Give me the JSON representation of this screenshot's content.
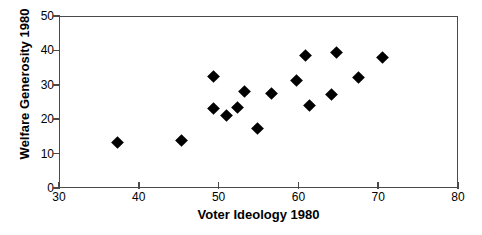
{
  "chart_data": {
    "type": "scatter",
    "title": "",
    "xlabel": "Voter Ideology 1980",
    "ylabel": "Welfare Generosity 1980",
    "xlim": [
      30,
      80
    ],
    "ylim": [
      0,
      50
    ],
    "xticks": [
      30,
      40,
      50,
      60,
      70,
      80
    ],
    "yticks": [
      0,
      10,
      20,
      30,
      40,
      50
    ],
    "xtick_labels": [
      "30",
      "40",
      "50",
      "60",
      "70",
      "80"
    ],
    "ytick_labels": [
      "0",
      "10",
      "20",
      "30",
      "40",
      "50"
    ],
    "grid": false,
    "legend": false,
    "marker": "diamond",
    "marker_color": "#000000",
    "frame_color": "#4a4a4a",
    "points": [
      {
        "x": 37.3,
        "y": 13.1
      },
      {
        "x": 45.3,
        "y": 13.7
      },
      {
        "x": 49.4,
        "y": 32.3
      },
      {
        "x": 49.4,
        "y": 23.0
      },
      {
        "x": 51.0,
        "y": 21.0
      },
      {
        "x": 52.4,
        "y": 23.3
      },
      {
        "x": 53.3,
        "y": 28.0
      },
      {
        "x": 54.9,
        "y": 17.2
      },
      {
        "x": 56.6,
        "y": 27.4
      },
      {
        "x": 59.8,
        "y": 31.2
      },
      {
        "x": 60.9,
        "y": 38.5
      },
      {
        "x": 61.4,
        "y": 23.9
      },
      {
        "x": 64.1,
        "y": 27.1
      },
      {
        "x": 64.8,
        "y": 39.4
      },
      {
        "x": 67.5,
        "y": 32.1
      },
      {
        "x": 70.6,
        "y": 37.9
      }
    ]
  }
}
